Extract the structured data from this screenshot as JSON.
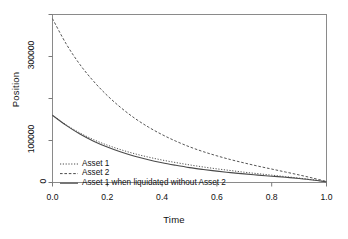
{
  "chart_data": {
    "type": "line",
    "title": "",
    "xlabel": "Time",
    "ylabel": "Position",
    "xlim": [
      0.0,
      1.0
    ],
    "ylim": [
      0,
      400000
    ],
    "grid": false,
    "legend_position": "bottom-left",
    "xticks": [
      "0.0",
      "0.2",
      "0.4",
      "0.6",
      "0.8",
      "1.0"
    ],
    "xtick_values": [
      0.0,
      0.2,
      0.4,
      0.6,
      0.8,
      1.0
    ],
    "yticks": [
      "0",
      "100000",
      "300000"
    ],
    "ytick_values": [
      0,
      100000,
      300000
    ],
    "ytick_minor_values": [
      200000,
      400000
    ],
    "x": [
      0.0,
      0.05,
      0.1,
      0.15,
      0.2,
      0.25,
      0.3,
      0.35,
      0.4,
      0.45,
      0.5,
      0.55,
      0.6,
      0.65,
      0.7,
      0.75,
      0.8,
      0.85,
      0.9,
      0.95,
      1.0
    ],
    "series": [
      {
        "name": "Asset 1",
        "style": "dotted",
        "color": "#555555",
        "values": [
          160000,
          137000,
          118000,
          102000,
          89000,
          78000,
          68500,
          60500,
          53500,
          47500,
          42000,
          37000,
          32500,
          28500,
          24500,
          21000,
          17500,
          14000,
          10500,
          6500,
          2000
        ]
      },
      {
        "name": "Asset 2",
        "style": "dashed",
        "color": "#555555",
        "values": [
          390000,
          330000,
          281000,
          241000,
          207000,
          178000,
          153000,
          132000,
          114000,
          98500,
          85000,
          73500,
          63500,
          54500,
          46500,
          39000,
          32000,
          25000,
          18000,
          10500,
          2500
        ]
      },
      {
        "name": "Asset 1 when liquidated without Asset 2",
        "style": "solid",
        "color": "#4a4a4a",
        "values": [
          160000,
          136000,
          115500,
          98500,
          84500,
          72500,
          62500,
          54000,
          47000,
          41000,
          35500,
          31000,
          27000,
          23500,
          20500,
          17500,
          15000,
          12500,
          9500,
          6000,
          1500
        ]
      }
    ]
  },
  "legend": {
    "items": [
      {
        "label": "Asset 1",
        "style": "dotted"
      },
      {
        "label": "Asset 2",
        "style": "dashed"
      },
      {
        "label": "Asset 1 when liquidated without Asset 2",
        "style": "solid"
      }
    ]
  },
  "axes": {
    "x_title": "Time",
    "y_title": "Position"
  }
}
